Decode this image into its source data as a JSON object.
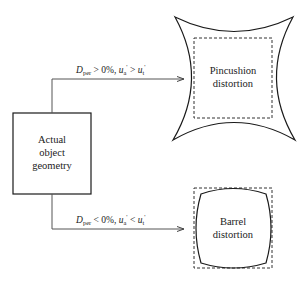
{
  "diagram": {
    "source_box": {
      "lines": [
        "Actual",
        "object",
        "geometry"
      ]
    },
    "top_branch": {
      "condition": {
        "D": "D",
        "D_sub": "per",
        "rel1": " > 0%, ",
        "u_a": "u",
        "u_a_sub": "a",
        "prime1": "'",
        "rel2": " > ",
        "u_t": "u",
        "u_t_sub": "t",
        "prime2": "'"
      },
      "target_lines": [
        "Pincushion",
        "distortion"
      ]
    },
    "bottom_branch": {
      "condition": {
        "D": "D",
        "D_sub": "per",
        "rel1": " < 0%, ",
        "u_a": "u",
        "u_a_sub": "a",
        "prime1": "'",
        "rel2": " < ",
        "u_t": "u",
        "u_t_sub": "t",
        "prime2": "'"
      },
      "target_lines": [
        "Barrel",
        "distortion"
      ]
    },
    "colors": {
      "stroke": "#1a1a1a",
      "connector": "#555555",
      "text": "#222222"
    }
  }
}
